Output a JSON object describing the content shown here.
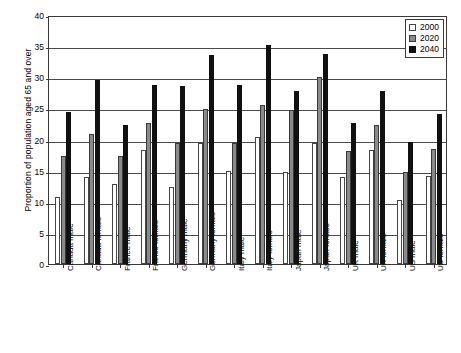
{
  "chart_data": {
    "type": "bar",
    "title": "",
    "xlabel": "",
    "ylabel": "Proportion of population aged 65 and over",
    "ylim": [
      0,
      40
    ],
    "yticks": [
      0,
      5,
      10,
      15,
      20,
      25,
      30,
      35,
      40
    ],
    "ytick_labels": [
      "0",
      "5",
      "10",
      "15",
      "20",
      "25",
      "30",
      "35",
      "40"
    ],
    "grid": true,
    "legend_position": "top-right",
    "categories": [
      "Canada male",
      "Canada female",
      "France male",
      "France female",
      "Germany male",
      "Germany female",
      "Italy male",
      "Italy female",
      "Japan male",
      "Japan female",
      "UK male",
      "UK female",
      "US male",
      "US female"
    ],
    "series": [
      {
        "name": "2000",
        "color": "#ffffff",
        "values": [
          10.8,
          14.0,
          12.9,
          18.3,
          12.4,
          19.4,
          15.0,
          20.4,
          14.8,
          19.5,
          14.0,
          18.3,
          10.3,
          14.2
        ]
      },
      {
        "name": "2020",
        "color": "#8a8a8a",
        "values": [
          17.4,
          20.9,
          17.3,
          22.7,
          19.5,
          24.9,
          19.5,
          25.5,
          24.7,
          30.1,
          18.1,
          22.3,
          14.8,
          18.5
        ]
      },
      {
        "name": "2040",
        "color": "#111111",
        "values": [
          24.4,
          29.5,
          22.3,
          28.7,
          28.6,
          33.6,
          28.7,
          35.2,
          27.8,
          33.8,
          22.6,
          27.8,
          19.6,
          24.1
        ]
      }
    ]
  },
  "legend": {
    "entries": [
      {
        "label": "2000",
        "swatch": "s2000"
      },
      {
        "label": "2020",
        "swatch": "s2020"
      },
      {
        "label": "2040",
        "swatch": "s2040"
      }
    ]
  }
}
